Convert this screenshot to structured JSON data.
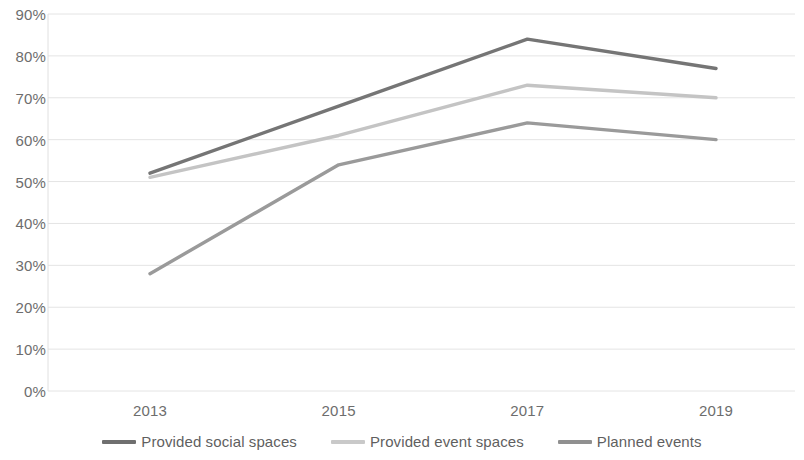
{
  "chart_data": {
    "type": "line",
    "title": "",
    "xlabel": "",
    "ylabel": "",
    "categories": [
      "2013",
      "2015",
      "2017",
      "2019"
    ],
    "x": [
      2013,
      2015,
      2017,
      2019
    ],
    "ylim": [
      0,
      0.9
    ],
    "y_ticks": [
      "0%",
      "10%",
      "20%",
      "30%",
      "40%",
      "50%",
      "60%",
      "70%",
      "80%",
      "90%"
    ],
    "y_tick_values": [
      0,
      10,
      20,
      30,
      40,
      50,
      60,
      70,
      80,
      90
    ],
    "grid": true,
    "legend_position": "bottom",
    "series": [
      {
        "name": "Provided social spaces",
        "color": "#757575",
        "values": [
          52,
          68,
          84,
          77
        ]
      },
      {
        "name": "Provided event spaces",
        "color": "#c4c4c4",
        "values": [
          51,
          61,
          73,
          70
        ]
      },
      {
        "name": "Planned events",
        "color": "#9a9a9a",
        "values": [
          28,
          54,
          64,
          60
        ]
      }
    ]
  },
  "axis": {
    "y_labels": [
      "90%",
      "80%",
      "70%",
      "60%",
      "50%",
      "40%",
      "30%",
      "20%",
      "10%",
      "0%"
    ],
    "x_labels": [
      "2013",
      "2015",
      "2017",
      "2019"
    ]
  },
  "legend": {
    "items": [
      {
        "label": "Provided social spaces",
        "color": "#6f6f6f"
      },
      {
        "label": "Provided event spaces",
        "color": "#c9c9c9"
      },
      {
        "label": "Planned events",
        "color": "#909090"
      }
    ]
  },
  "colors": {
    "background": "#ffffff",
    "grid": "#e4e4e4",
    "axis_text": "#6d6d6d"
  }
}
